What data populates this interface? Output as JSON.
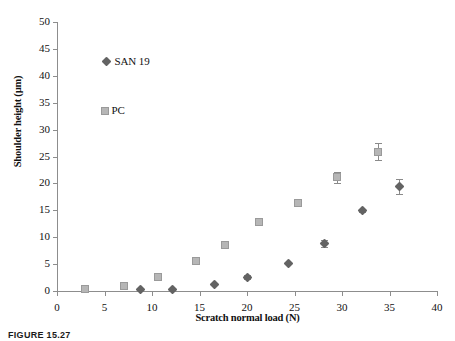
{
  "figure": {
    "caption": "FIGURE 15.27"
  },
  "chart_data": {
    "type": "scatter",
    "title": "",
    "xlabel": "Scratch normal load (N)",
    "ylabel": "Shoulder height (µm)",
    "xlim": [
      0,
      40
    ],
    "ylim": [
      0,
      50
    ],
    "xticks": [
      0,
      5,
      10,
      15,
      20,
      25,
      30,
      35,
      40
    ],
    "yticks": [
      0,
      5,
      10,
      15,
      20,
      25,
      30,
      35,
      40,
      45,
      50
    ],
    "xtick_labels": [
      "0",
      "5",
      "10",
      "15",
      "20",
      "25",
      "30",
      "35",
      "40"
    ],
    "ytick_labels": [
      "0",
      "5",
      "10",
      "15",
      "20",
      "25",
      "30",
      "35",
      "40",
      "45",
      "50"
    ],
    "grid": false,
    "legend_position": "upper-left-inside",
    "series": [
      {
        "name": "SAN 19",
        "marker": "diamond",
        "color": "#636363",
        "points": [
          {
            "x": 8.8,
            "y": 0.3,
            "yerr": 0
          },
          {
            "x": 12.2,
            "y": 0.3,
            "yerr": 0
          },
          {
            "x": 16.6,
            "y": 1.3,
            "yerr": 0
          },
          {
            "x": 20.1,
            "y": 2.6,
            "yerr": 0.3
          },
          {
            "x": 24.4,
            "y": 5.2,
            "yerr": 0
          },
          {
            "x": 28.2,
            "y": 8.8,
            "yerr": 0.7
          },
          {
            "x": 32.2,
            "y": 15.0,
            "yerr": 0.3
          },
          {
            "x": 36.0,
            "y": 19.5,
            "yerr": 1.4
          }
        ]
      },
      {
        "name": "PC",
        "marker": "square",
        "color": "#b6b6b6",
        "points": [
          {
            "x": 2.9,
            "y": 0.3,
            "yerr": 0
          },
          {
            "x": 7.0,
            "y": 1.0,
            "yerr": 0
          },
          {
            "x": 10.6,
            "y": 2.6,
            "yerr": 0
          },
          {
            "x": 14.6,
            "y": 5.5,
            "yerr": 0
          },
          {
            "x": 17.7,
            "y": 8.5,
            "yerr": 0
          },
          {
            "x": 21.3,
            "y": 12.9,
            "yerr": 0
          },
          {
            "x": 25.4,
            "y": 16.4,
            "yerr": 0
          },
          {
            "x": 29.5,
            "y": 21.1,
            "yerr": 1.0
          },
          {
            "x": 33.8,
            "y": 25.9,
            "yerr": 1.6
          }
        ]
      }
    ],
    "legend": [
      {
        "label": "SAN 19",
        "marker": "diamond",
        "color": "#636363",
        "at_x": 5.1,
        "at_y": 42.6
      },
      {
        "label": "PC",
        "marker": "square",
        "color": "#b6b6b6",
        "at_x": 5.1,
        "at_y": 33.4
      }
    ]
  }
}
